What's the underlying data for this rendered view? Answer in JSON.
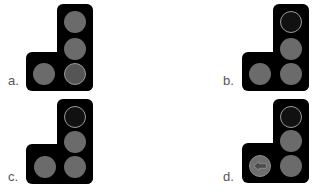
{
  "panels": [
    {
      "label": "a.",
      "lamps": {
        "top": "off",
        "middle": "off",
        "bottom_right": "ringed-dim",
        "bottom_left": "off"
      }
    },
    {
      "label": "b.",
      "lamps": {
        "top": "dark-ringed",
        "middle": "off",
        "bottom_right": "off",
        "bottom_left": "off"
      }
    },
    {
      "label": "c.",
      "lamps": {
        "top": "dark-ringed",
        "middle": "off",
        "bottom_right": "off",
        "bottom_left": "off"
      }
    },
    {
      "label": "d.",
      "lamps": {
        "top": "dark-ringed",
        "middle": "off",
        "bottom_right": "off",
        "bottom_left": "left-arrow"
      }
    }
  ],
  "colors": {
    "housing": "#000000",
    "lamp_off": "#6b6b6b",
    "lamp_dark": "#111111",
    "lamp_ring": "#9a9a9a",
    "label": "#555555"
  }
}
